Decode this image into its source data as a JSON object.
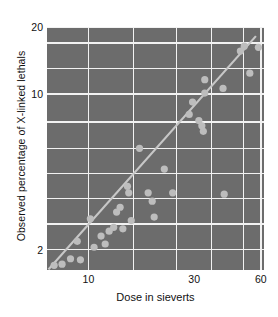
{
  "chart_data": {
    "type": "scatter",
    "title": "",
    "subtitle": "",
    "xlabel": "Dose in sieverts",
    "ylabel": "Observed percentage of X-linked lethals",
    "xscale": "log",
    "yscale": "log",
    "xlim": [
      6.5,
      62
    ],
    "ylim": [
      1.62,
      20
    ],
    "xticks": [
      10,
      30,
      60
    ],
    "xtick_labels": [
      "10",
      "30",
      "60"
    ],
    "yticks": [
      2,
      10,
      20
    ],
    "ytick_labels": [
      "2",
      "10",
      "20"
    ],
    "grid": true,
    "grid_x_values": [
      10,
      16,
      25,
      36,
      50,
      60
    ],
    "grid_y_values": [
      2,
      2.6,
      3.4,
      4.4,
      5.7,
      7.5,
      10,
      13,
      17,
      20
    ],
    "legend": null,
    "legend_position": "none",
    "annotations": [],
    "series": [
      {
        "name": "Observed percentage of X-linked lethals vs dose",
        "marker": "circle",
        "marker_color": "#bdbdbd",
        "points": [
          {
            "x": 7.0,
            "y": 1.7
          },
          {
            "x": 7.6,
            "y": 1.72
          },
          {
            "x": 8.3,
            "y": 1.82
          },
          {
            "x": 9.2,
            "y": 1.8
          },
          {
            "x": 8.9,
            "y": 2.18
          },
          {
            "x": 10.2,
            "y": 2.75
          },
          {
            "x": 10.6,
            "y": 2.05
          },
          {
            "x": 11.4,
            "y": 2.3
          },
          {
            "x": 11.9,
            "y": 2.12
          },
          {
            "x": 12.4,
            "y": 2.42
          },
          {
            "x": 13.0,
            "y": 2.52
          },
          {
            "x": 13.4,
            "y": 2.95
          },
          {
            "x": 13.9,
            "y": 3.1
          },
          {
            "x": 14.3,
            "y": 2.48
          },
          {
            "x": 15.0,
            "y": 3.85
          },
          {
            "x": 15.2,
            "y": 3.6
          },
          {
            "x": 15.6,
            "y": 2.7
          },
          {
            "x": 17.0,
            "y": 5.7
          },
          {
            "x": 18.6,
            "y": 3.6
          },
          {
            "x": 19.4,
            "y": 3.3
          },
          {
            "x": 19.8,
            "y": 2.8
          },
          {
            "x": 22.0,
            "y": 4.6
          },
          {
            "x": 24.0,
            "y": 3.6
          },
          {
            "x": 28.5,
            "y": 8.1
          },
          {
            "x": 29.5,
            "y": 9.2
          },
          {
            "x": 31.5,
            "y": 7.6
          },
          {
            "x": 32.5,
            "y": 7.2
          },
          {
            "x": 33.0,
            "y": 6.8
          },
          {
            "x": 33.5,
            "y": 11.6
          },
          {
            "x": 33.5,
            "y": 10.1
          },
          {
            "x": 40.5,
            "y": 10.6
          },
          {
            "x": 41.0,
            "y": 3.55
          },
          {
            "x": 48.5,
            "y": 15.6
          },
          {
            "x": 50.5,
            "y": 16.4
          },
          {
            "x": 53.5,
            "y": 12.4
          },
          {
            "x": 58.5,
            "y": 16.2
          }
        ]
      }
    ],
    "fit_line": {
      "name": "fitted trend line",
      "color": "#c7c7c7",
      "x_start": 6.6,
      "y_start": 1.63,
      "x_end": 57.0,
      "y_end": 18.2
    }
  },
  "style": {
    "panel_bg": "#6c6c6c",
    "grid_color": "#f2f2f2",
    "marker_color": "#bdbdbd",
    "line_color": "#c7c7c7",
    "text_color": "#111111",
    "page_bg": "#ffffff"
  }
}
